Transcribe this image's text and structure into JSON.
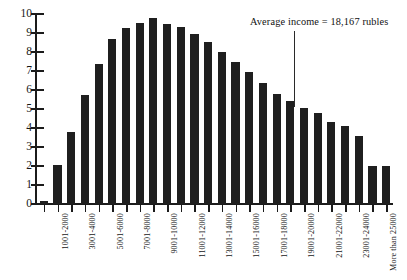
{
  "chart_data": {
    "type": "bar",
    "title": "",
    "xlabel": "",
    "ylabel": "",
    "ylim": [
      0,
      10
    ],
    "ytick_labels": [
      "0",
      "1",
      "2",
      "3",
      "4",
      "5",
      "6",
      "7",
      "8",
      "9",
      "10"
    ],
    "ytick_values": [
      0,
      1,
      2,
      3,
      4,
      5,
      6,
      7,
      8,
      9,
      10
    ],
    "grid": false,
    "legend": "none",
    "categories": [
      "1-1000",
      "1001-2000",
      "2001-3000",
      "3001-4000",
      "4001-5000",
      "5001-6000",
      "6001-7000",
      "7001-8000",
      "8001-9000",
      "9001-10000",
      "10001-11000",
      "11001-12000",
      "12001-13000",
      "13001-14000",
      "14001-15000",
      "15001-16000",
      "16001-17000",
      "17001-18000",
      "18001-19000",
      "19001-20000",
      "20001-21000",
      "21001-22000",
      "22001-23000",
      "23001-24000",
      "24001-25000",
      "More than 25000"
    ],
    "values": [
      0.15,
      2.05,
      3.8,
      5.75,
      7.35,
      8.7,
      9.25,
      9.55,
      9.8,
      9.5,
      9.3,
      8.95,
      8.55,
      8.0,
      7.45,
      6.95,
      6.35,
      5.8,
      5.4,
      5.05,
      4.8,
      4.3,
      4.1,
      3.6,
      2.0,
      2.0
    ],
    "visible_tick_labels": [
      "1001-2000",
      "3001-4000",
      "5001-6000",
      "7001-8000",
      "9001-10000",
      "11001-12000",
      "13001-14000",
      "15001-16000",
      "17001-18000",
      "19001-20000",
      "21001-22000",
      "23001-24000",
      "More than 25000"
    ],
    "visible_tick_indices": [
      1,
      3,
      5,
      7,
      9,
      11,
      13,
      15,
      17,
      19,
      21,
      23,
      25
    ],
    "annotations": [
      {
        "text": "Average income = 18,167 rubles",
        "value": 18167,
        "pointer": "vertical-line"
      }
    ],
    "bar_color": "#1f1f1f",
    "axis_color": "#1b1b1b"
  }
}
